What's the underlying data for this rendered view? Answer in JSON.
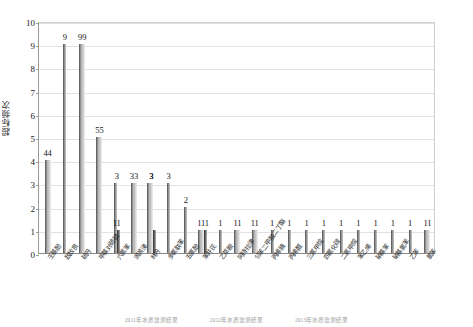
{
  "chart_data": {
    "type": "bar",
    "title": "",
    "xlabel": "",
    "ylabel": "超标频次",
    "ylim": [
      0,
      10
    ],
    "yticks": [
      0,
      1,
      2,
      3,
      4,
      5,
      6,
      7,
      8,
      9,
      10
    ],
    "grid": true,
    "legend_position": "bottom",
    "categories": [
      "壬基酚",
      "敌敌畏",
      "硫丹",
      "甲基对硫磷",
      "六氯苯",
      "滴滴涕",
      "林丹",
      "多氯联苯",
      "五氯酚",
      "苯并芘",
      "乙草胺",
      "阿特拉津",
      "邻苯二甲酸二丁酯",
      "丙烯腈",
      "丙烯醛",
      "三氯甲烷",
      "四氯化碳",
      "二氯甲烷",
      "苯乙烯",
      "硝基苯",
      "硝基氯苯",
      "乙苯",
      "氯苯"
    ],
    "series": [
      {
        "name": "2011年水质监测结果",
        "values": [
          4,
          9,
          9,
          5,
          3,
          3,
          3,
          3,
          2,
          1,
          1,
          1,
          1,
          1,
          1,
          1,
          1,
          1,
          1,
          1,
          1,
          1,
          1
        ]
      },
      {
        "name": "2012年水质监测结果",
        "values": [
          4,
          0,
          9,
          5,
          0,
          3,
          3,
          0,
          0,
          1,
          0,
          1,
          1,
          0,
          0,
          0,
          0,
          0,
          0,
          0,
          0,
          0,
          1
        ]
      },
      {
        "name": "2013年水质监测结果",
        "values": [
          0,
          0,
          0,
          0,
          1,
          0,
          1,
          0,
          0,
          1,
          0,
          0,
          0,
          0,
          0,
          0,
          0,
          0,
          0,
          0,
          0,
          0,
          0
        ]
      }
    ],
    "bar_labels": [
      "44",
      "9",
      "99",
      "55",
      "3",
      "33",
      "3",
      "3",
      "2",
      "111",
      "1",
      "11",
      "11",
      "1",
      "1",
      "1",
      "1",
      "1",
      "1",
      "1",
      "1",
      "1",
      "11"
    ],
    "inner_labels": [
      {
        "index": 4,
        "text": "11",
        "value": 1
      },
      {
        "index": 6,
        "text": "3",
        "value": 3
      }
    ],
    "caption_items": [
      "2011年水质监测结果",
      "2012年水质监测结果",
      "2013年水质监测结果"
    ],
    "accent_colors": {
      "series1": "#6f6f6f",
      "series2": "#c9c9c9",
      "series3": "#3a3a3a",
      "grid": "#e2e2e2",
      "axis": "#8a8a8a"
    }
  }
}
